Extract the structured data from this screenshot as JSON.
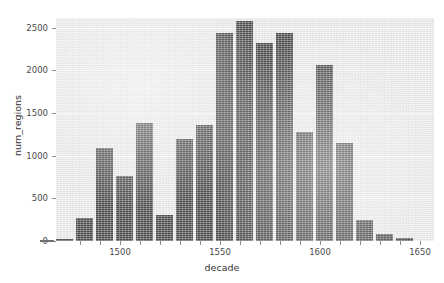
{
  "chart_data": {
    "type": "bar",
    "title": "",
    "xlabel": "decade",
    "ylabel": "num_regions",
    "categories": [
      1480,
      1490,
      1500,
      1510,
      1520,
      1530,
      1540,
      1550,
      1560,
      1570,
      1580,
      1590,
      1600,
      1610,
      1620,
      1630,
      1640,
      1650
    ],
    "values": [
      270,
      1090,
      760,
      1380,
      300,
      1200,
      1360,
      2440,
      2580,
      2320,
      2440,
      1280,
      2060,
      1150,
      250,
      80,
      30,
      20
    ],
    "bars": [
      {
        "decade": 1470,
        "value": 20
      },
      {
        "decade": 1480,
        "value": 270
      },
      {
        "decade": 1490,
        "value": 1090
      },
      {
        "decade": 1500,
        "value": 760
      },
      {
        "decade": 1510,
        "value": 1380
      },
      {
        "decade": 1520,
        "value": 300
      },
      {
        "decade": 1530,
        "value": 1200
      },
      {
        "decade": 1540,
        "value": 1360
      },
      {
        "decade": 1550,
        "value": 2440
      },
      {
        "decade": 1560,
        "value": 2580
      },
      {
        "decade": 1570,
        "value": 2320
      },
      {
        "decade": 1580,
        "value": 2440
      },
      {
        "decade": 1590,
        "value": 1280
      },
      {
        "decade": 1600,
        "value": 2060
      },
      {
        "decade": 1610,
        "value": 1150
      },
      {
        "decade": 1620,
        "value": 250
      },
      {
        "decade": 1630,
        "value": 80
      },
      {
        "decade": 1640,
        "value": 30
      }
    ],
    "xlim": [
      1468,
      1657
    ],
    "ylim": [
      0,
      2615
    ],
    "yticks": [
      0,
      500,
      1000,
      1500,
      2000,
      2500
    ],
    "xticks": [
      1500,
      1550,
      1600,
      1650
    ],
    "xtickminor": [
      1480,
      1490,
      1510,
      1520,
      1530,
      1540,
      1560,
      1570,
      1580,
      1590,
      1610,
      1620,
      1630,
      1640
    ],
    "grid": "horizontal",
    "legend": "none",
    "colors": {
      "bar": "#4d4d4d",
      "panel": "#eaeaea",
      "gridline": "#f7f7f7",
      "text": "#4a4a4a",
      "axis": "#8a8a8a",
      "background": "#ffffff"
    }
  },
  "axis": {
    "x_title": "decade",
    "y_title": "num_regions",
    "y_tick_labels": [
      "0",
      "500",
      "1000",
      "1500",
      "2000",
      "2500"
    ],
    "x_tick_labels": [
      "1500",
      "1550",
      "1600",
      "1650"
    ]
  }
}
